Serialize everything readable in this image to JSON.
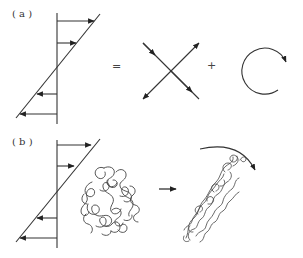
{
  "panels": [
    {
      "label": "( a )",
      "equals_sign": "=",
      "plus_sign": "+",
      "components": [
        "simple-shear-profile",
        "pure-strain-cross",
        "rotation-circle"
      ]
    },
    {
      "label": "( b )",
      "transition_arrow": "→",
      "components": [
        "simple-shear-profile",
        "coiled-polymer",
        "stretched-rotated-polymer",
        "rotation-arc"
      ]
    }
  ],
  "colors": {
    "line": "#333333",
    "background": "#ffffff"
  }
}
